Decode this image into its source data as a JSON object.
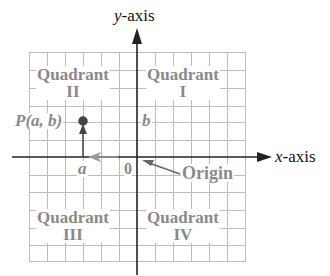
{
  "axes": {
    "y_label_var": "y",
    "y_label_suffix": "-axis",
    "x_label_var": "x",
    "x_label_suffix": "-axis"
  },
  "quadrants": [
    {
      "word": "Quadrant",
      "numeral": "II"
    },
    {
      "word": "Quadrant",
      "numeral": "I"
    },
    {
      "word": "Quadrant",
      "numeral": "III"
    },
    {
      "word": "Quadrant",
      "numeral": "IV"
    }
  ],
  "point": {
    "label": "P(a, b)"
  },
  "marks": {
    "a": "a",
    "b": "b",
    "zero": "0"
  },
  "origin": {
    "label": "Origin"
  },
  "colors": {
    "grid": "#b8b8b8",
    "axis": "#222222",
    "label_gray": "#8a8a8a"
  }
}
